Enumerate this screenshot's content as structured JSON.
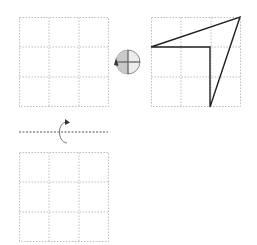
{
  "diagram": {
    "colors": {
      "grid": "#bdbdbd",
      "shape_stroke": "#222222",
      "dial_fill": "#e2e2e2",
      "axis_line": "#555555"
    },
    "grids": [
      {
        "name": "source-grid",
        "x": 19,
        "y": 17,
        "size": 89,
        "cells": 3,
        "empty": true
      },
      {
        "name": "shape-grid",
        "x": 151,
        "y": 17,
        "size": 89,
        "cells": 3,
        "empty": false
      },
      {
        "name": "answer-grid",
        "x": 19,
        "y": 152,
        "size": 89,
        "cells": 3,
        "empty": true
      }
    ],
    "shape": {
      "type": "polygon",
      "points": [
        [
          151,
          47
        ],
        [
          240,
          17
        ],
        [
          210,
          107
        ],
        [
          210,
          47
        ]
      ]
    },
    "rotation_dial": {
      "cx": 128,
      "cy": 62,
      "r": 12,
      "shaded_quadrant": "left-half",
      "arrow": "counter-clockwise"
    },
    "flip_axis": {
      "orientation": "horizontal",
      "y": 132,
      "x1": 19,
      "x2": 108,
      "arrow": "rotate-around-horizontal-axis"
    }
  }
}
